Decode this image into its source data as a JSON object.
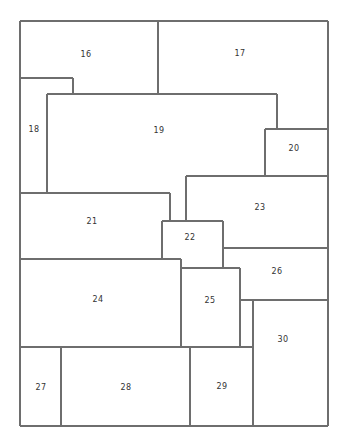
{
  "diagram": {
    "type": "floor-plan-partition",
    "regions": [
      {
        "id": "region-16",
        "label": "16"
      },
      {
        "id": "region-17",
        "label": "17"
      },
      {
        "id": "region-18",
        "label": "18"
      },
      {
        "id": "region-19",
        "label": "19"
      },
      {
        "id": "region-20",
        "label": "20"
      },
      {
        "id": "region-21",
        "label": "21"
      },
      {
        "id": "region-22",
        "label": "22"
      },
      {
        "id": "region-23",
        "label": "23"
      },
      {
        "id": "region-24",
        "label": "24"
      },
      {
        "id": "region-25",
        "label": "25"
      },
      {
        "id": "region-26",
        "label": "26"
      },
      {
        "id": "region-27",
        "label": "27"
      },
      {
        "id": "region-28",
        "label": "28"
      },
      {
        "id": "region-29",
        "label": "29"
      },
      {
        "id": "region-30",
        "label": "30"
      }
    ],
    "colors": {
      "line": "#6e6e6e",
      "label": "#333333",
      "background": "#ffffff"
    }
  }
}
